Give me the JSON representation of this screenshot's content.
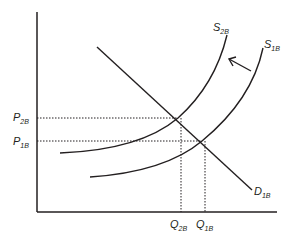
{
  "diagram": {
    "type": "supply-demand shift",
    "axes": {
      "x": "Quantity",
      "y": "Price"
    },
    "curves": [
      {
        "id": "S2B",
        "label": "S",
        "subscript": "2B",
        "kind": "supply"
      },
      {
        "id": "S1B",
        "label": "S",
        "subscript": "1B",
        "kind": "supply"
      },
      {
        "id": "D1B",
        "label": "D",
        "subscript": "1B",
        "kind": "demand"
      }
    ],
    "price_labels": [
      {
        "label": "P",
        "subscript": "2B"
      },
      {
        "label": "P",
        "subscript": "1B"
      }
    ],
    "quantity_labels": [
      {
        "label": "Q",
        "subscript": "2B"
      },
      {
        "label": "Q",
        "subscript": "1B"
      }
    ],
    "shift_arrow": {
      "direction": "leftward",
      "from": "S1B",
      "to": "S2B"
    },
    "colors": {
      "ink": "#231f20",
      "background": "#ffffff"
    }
  }
}
